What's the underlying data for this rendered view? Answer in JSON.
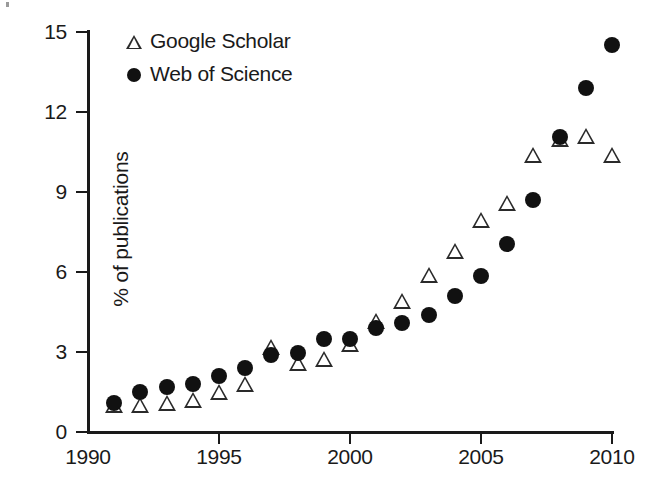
{
  "chart_data": {
    "type": "scatter",
    "title": "",
    "xlabel": "",
    "ylabel": "% of publications",
    "xlim": [
      1990,
      2010
    ],
    "ylim": [
      0,
      15
    ],
    "xticks": [
      1990,
      1995,
      2000,
      2005,
      2010
    ],
    "yticks": [
      0,
      3,
      6,
      9,
      12,
      15
    ],
    "grid": false,
    "legend_position": "top-left",
    "x": [
      1991,
      1992,
      1993,
      1994,
      1995,
      1996,
      1997,
      1998,
      1999,
      2000,
      2001,
      2002,
      2003,
      2004,
      2005,
      2006,
      2007,
      2008,
      2009,
      2010
    ],
    "series": [
      {
        "name": "Google Scholar",
        "marker": "open-triangle",
        "color": "#2a2a2a",
        "values": [
          1.0,
          1.0,
          1.1,
          1.2,
          1.5,
          1.8,
          3.2,
          2.6,
          2.75,
          3.3,
          4.15,
          4.9,
          5.9,
          6.8,
          7.95,
          8.6,
          10.4,
          11.0,
          11.1,
          10.4
        ]
      },
      {
        "name": "Web of Science",
        "marker": "filled-circle",
        "color": "#111111",
        "values": [
          1.1,
          1.5,
          1.7,
          1.8,
          2.1,
          2.4,
          2.9,
          2.95,
          3.5,
          3.5,
          3.9,
          4.1,
          4.4,
          5.1,
          5.85,
          7.05,
          8.7,
          11.05,
          12.9,
          14.5
        ]
      }
    ]
  },
  "axes": {
    "y_label": "% of publications",
    "y_tick_labels": [
      "0",
      "3",
      "6",
      "9",
      "12",
      "15"
    ],
    "x_tick_labels": [
      "1990",
      "1995",
      "2000",
      "2005",
      "2010"
    ]
  },
  "legend": {
    "entries": [
      {
        "label": "Google Scholar",
        "symbol": "open-triangle"
      },
      {
        "label": "Web of Science",
        "symbol": "filled-circle"
      }
    ]
  }
}
